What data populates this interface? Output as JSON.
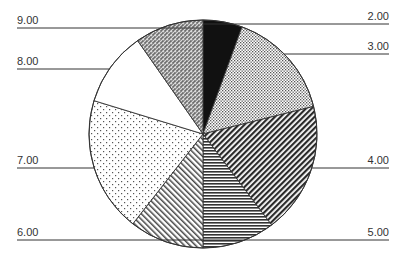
{
  "chart_data": {
    "type": "pie",
    "title": "",
    "start_angle_deg": 0,
    "direction": "clockwise",
    "categories": [
      "2.00",
      "3.00",
      "4.00",
      "5.00",
      "6.00",
      "7.00",
      "8.00",
      "9.00"
    ],
    "values": [
      5.6,
      15.6,
      18.6,
      10.3,
      10.6,
      19.2,
      10.6,
      9.7
    ],
    "value_units": "approximate percent (estimated from slice angles; no values printed)",
    "slices": [
      {
        "label": "2.00",
        "angle": 20,
        "pattern": "solid-black",
        "side": "right",
        "label_y": 20,
        "line_y": 24
      },
      {
        "label": "3.00",
        "angle": 56,
        "pattern": "fine-dots",
        "side": "right",
        "label_y": 50,
        "line_y": 54
      },
      {
        "label": "4.00",
        "angle": 67,
        "pattern": "dense-diagonal-back",
        "side": "right",
        "label_y": 164,
        "line_y": 168
      },
      {
        "label": "5.00",
        "angle": 37,
        "pattern": "horizontal-lines",
        "side": "right",
        "label_y": 236,
        "line_y": 240
      },
      {
        "label": "6.00",
        "angle": 38,
        "pattern": "diagonal-forward",
        "side": "left",
        "label_y": 236,
        "line_y": 240
      },
      {
        "label": "7.00",
        "angle": 69,
        "pattern": "sparse-dots",
        "side": "left",
        "label_y": 164,
        "line_y": 168
      },
      {
        "label": "8.00",
        "angle": 38,
        "pattern": "white",
        "side": "left",
        "label_y": 65,
        "line_y": 69
      },
      {
        "label": "9.00",
        "angle": 35,
        "pattern": "checker-crosshatch",
        "side": "left",
        "label_y": 24,
        "line_y": 28
      }
    ],
    "legend": "none (leader-line labels)",
    "grid": false
  },
  "geometry": {
    "cx": 203,
    "cy": 134,
    "r": 114
  },
  "colors": {
    "outline": "#333333",
    "ink": "#222222",
    "background": "#ffffff"
  }
}
